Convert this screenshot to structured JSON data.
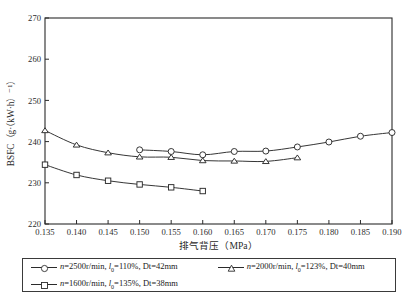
{
  "chart_data": {
    "type": "line",
    "title": "",
    "xlabel": "排气背压（MPa）",
    "ylabel": "BSFC（g·（kW·h）⁻¹）",
    "xlim": [
      0.135,
      0.19
    ],
    "ylim": [
      220,
      270
    ],
    "xticks": [
      0.135,
      0.14,
      0.145,
      0.15,
      0.155,
      0.16,
      0.165,
      0.17,
      0.175,
      0.18,
      0.185,
      0.19
    ],
    "xtick_labels": [
      "0.135",
      "0.140",
      "0.145",
      "0.150",
      "0.155",
      "0.160",
      "0.165",
      "0.170",
      "0.175",
      "0.180",
      "0.185",
      "0.190"
    ],
    "yticks": [
      220,
      230,
      240,
      250,
      260,
      270
    ],
    "ytick_labels": [
      "220",
      "230",
      "240",
      "250",
      "260",
      "270"
    ],
    "grid": false,
    "legend_position": "below",
    "series": [
      {
        "name": "n=2500r/min, l0=110%, Dt=42mm",
        "marker": "circle",
        "x": [
          0.15,
          0.155,
          0.16,
          0.165,
          0.17,
          0.175,
          0.18,
          0.185,
          0.19
        ],
        "values": [
          238.0,
          237.6,
          236.8,
          237.6,
          237.7,
          238.7,
          239.9,
          241.3,
          242.2
        ]
      },
      {
        "name": "n=2000r/min, l0=123%, Dt=40mm",
        "marker": "triangle",
        "x": [
          0.135,
          0.14,
          0.145,
          0.15,
          0.155,
          0.16,
          0.165,
          0.17,
          0.175
        ],
        "values": [
          242.7,
          239.2,
          237.3,
          236.3,
          236.2,
          235.4,
          235.3,
          235.2,
          236.1
        ]
      },
      {
        "name": "n=1600r/min, l0=135%, Dt=38mm",
        "marker": "square",
        "x": [
          0.135,
          0.14,
          0.145,
          0.15,
          0.155,
          0.16
        ],
        "values": [
          234.4,
          231.9,
          230.5,
          229.6,
          228.9,
          228.0
        ]
      }
    ]
  },
  "axes": {
    "y_label_text": "BSFC（g·（kW·h）⁻¹）",
    "x_label_text": "排气背压（MPa）"
  },
  "legend": {
    "entries": [
      {
        "marker": "circle",
        "var_italic": "n",
        "text_a": "=2500r/min, ",
        "sym_italic": "l",
        "sym_sub": "0",
        "text_b": "=110%, Dt=42mm"
      },
      {
        "marker": "triangle",
        "var_italic": "n",
        "text_a": "=2000r/min, ",
        "sym_italic": "l",
        "sym_sub": "0",
        "text_b": "=123%, Dt=40mm"
      },
      {
        "marker": "square",
        "var_italic": "n",
        "text_a": "=1600r/min, ",
        "sym_italic": "l",
        "sym_sub": "0",
        "text_b": "=135%, Dt=38mm"
      }
    ]
  },
  "colors": {
    "axis": "#2b2b2b",
    "line": "#2b2b2b",
    "marker_fill": "#ffffff",
    "background": "#ffffff"
  }
}
